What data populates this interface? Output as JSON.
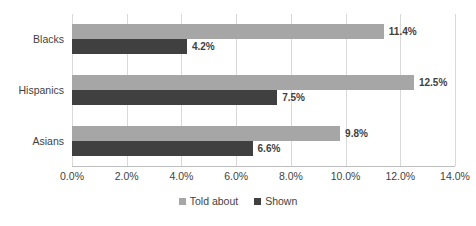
{
  "chart_data": {
    "type": "bar",
    "orientation": "horizontal",
    "title": "",
    "subtitle": "",
    "xlabel": "",
    "ylabel": "",
    "categories": [
      "Blacks",
      "Hispanics",
      "Asians"
    ],
    "series": [
      {
        "name": "Told about",
        "color": "#A6A6A6",
        "values": [
          11.4,
          12.5,
          9.8
        ],
        "labels": [
          "11.4%",
          "12.5%",
          "9.8%"
        ]
      },
      {
        "name": "Shown",
        "color": "#404040",
        "values": [
          4.2,
          7.5,
          6.6
        ],
        "labels": [
          "4.2%",
          "7.5%",
          "6.6%"
        ]
      }
    ],
    "xlim": [
      0,
      14
    ],
    "xticks": [
      0,
      2,
      4,
      6,
      8,
      10,
      12,
      14
    ],
    "xtick_labels": [
      "0.0%",
      "2.0%",
      "4.0%",
      "6.0%",
      "8.0%",
      "10.0%",
      "12.0%",
      "14.0%"
    ],
    "grid": true,
    "grid_axis": "x",
    "legend_position": "bottom",
    "gridline_color": "#D9D9D9",
    "axis_color": "#BFBFBF",
    "text_color": "#3F3F3F",
    "background": "#FFFFFF"
  }
}
